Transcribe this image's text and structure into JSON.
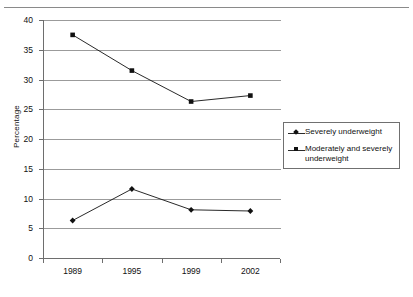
{
  "chart_data": {
    "type": "line",
    "title": "",
    "subtitle": "",
    "xlabel": "",
    "ylabel": "Percentage",
    "categories": [
      "1989",
      "1995",
      "1999",
      "2002"
    ],
    "ylim": [
      0,
      40
    ],
    "yticks": [
      0,
      5,
      10,
      15,
      20,
      25,
      30,
      35,
      40
    ],
    "ytick_labels": [
      "0",
      "5",
      "10",
      "15",
      "20",
      "25",
      "30",
      "35",
      "40"
    ],
    "grid": true,
    "grid_axis": "y",
    "legend_position": "right",
    "series": [
      {
        "name": "Severely underweight",
        "marker": "diamond",
        "color": "#111111",
        "values": [
          6.3,
          11.6,
          8.1,
          7.9
        ]
      },
      {
        "name": "Moderately and severely underweight",
        "marker": "square",
        "color": "#111111",
        "values": [
          37.5,
          31.5,
          26.3,
          27.3
        ]
      }
    ]
  },
  "legend": {
    "entries": [
      {
        "label": "Severely underweight",
        "marker": "diamond"
      },
      {
        "label": "Moderately and severely underweight",
        "marker": "square"
      }
    ]
  },
  "axis": {
    "y_title": "Percentage"
  }
}
